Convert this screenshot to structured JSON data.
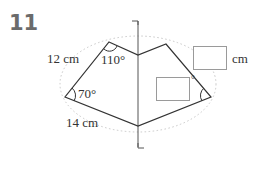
{
  "problem": {
    "number": "11"
  },
  "figure": {
    "type": "line-symmetric pentagon-like figure (kite with notch) with axis of symmetry",
    "labels": {
      "side_top_left": "12 cm",
      "side_bottom_left": "14 cm",
      "angle_top_left": "110°",
      "angle_left": "70°"
    },
    "answer_boxes": {
      "side_top_right": {
        "value": "",
        "unit": "cm"
      },
      "angle_right": {
        "value": "",
        "unit": "°"
      }
    },
    "colors": {
      "stroke": "#333333",
      "dotted": "#c8c8c8",
      "box_border": "#9a9a9a",
      "number": "#6b6b6b"
    }
  }
}
